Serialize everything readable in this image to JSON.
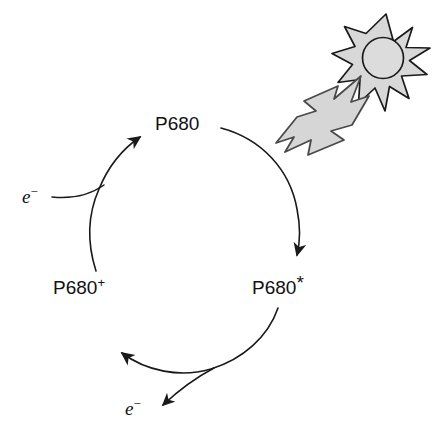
{
  "figure": {
    "type": "cycle-diagram",
    "background_color": "#ffffff",
    "stroke_color": "#1a1a1a",
    "text_color": "#111111"
  },
  "nodes": [
    {
      "id": "p680",
      "label": "P680",
      "base": "P680",
      "superscript": "",
      "position": "top"
    },
    {
      "id": "p680-star",
      "label": "P680*",
      "base": "P680",
      "superscript": "*",
      "position": "bottom-right"
    },
    {
      "id": "p680-plus",
      "label": "P680+",
      "base": "P680",
      "superscript": "+",
      "position": "bottom-left"
    }
  ],
  "electrons": [
    {
      "id": "electron-in",
      "base": "e",
      "superscript": "−",
      "label": "e−",
      "position": "left",
      "direction": "into-cycle"
    },
    {
      "id": "electron-out",
      "base": "e",
      "superscript": "−",
      "label": "e−",
      "position": "bottom",
      "direction": "out-of-cycle"
    }
  ],
  "light": {
    "sun": {
      "name": "sun-icon",
      "points": 8,
      "fill": "#d8d8d8",
      "core_fill": "#dcdcdc",
      "stroke": "#1a1a1a"
    },
    "bolt": {
      "name": "lightning-bolt-arrow",
      "fill": "#d6d6d6",
      "stroke": "#4a4a4a",
      "direction": "down-left",
      "meaning": "photon absorption"
    }
  },
  "arrows": [
    {
      "id": "arrow-p680-to-star",
      "from": "p680",
      "to": "p680-star",
      "side": "right"
    },
    {
      "id": "arrow-star-to-plus",
      "from": "p680-star",
      "to": "p680-plus",
      "side": "bottom"
    },
    {
      "id": "arrow-plus-to-p680",
      "from": "p680-plus",
      "to": "p680",
      "side": "left"
    },
    {
      "id": "arrow-electron-in",
      "from": "electron-in",
      "to": "p680",
      "side": "upper-left"
    },
    {
      "id": "arrow-electron-out",
      "from": "p680-star",
      "to": "electron-out",
      "side": "lower-left"
    }
  ]
}
